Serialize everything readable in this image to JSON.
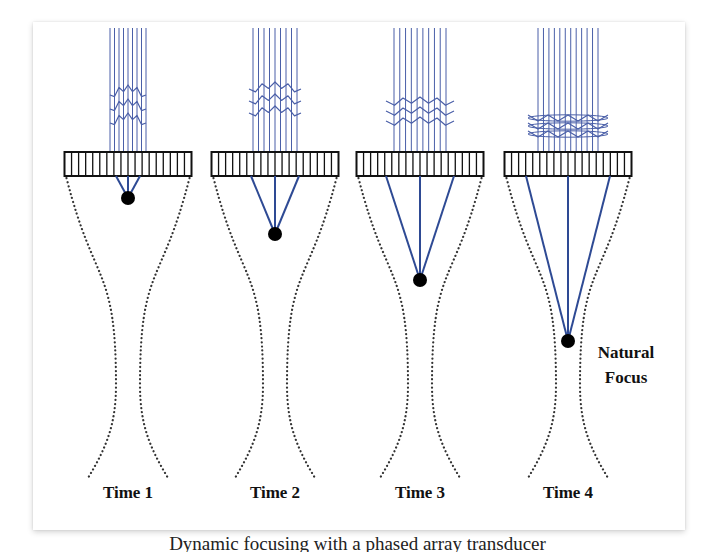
{
  "figure": {
    "panels": [
      {
        "label": "Time 1",
        "cx": 128,
        "focus_y": 198
      },
      {
        "label": "Time 2",
        "cx": 275,
        "focus_y": 234
      },
      {
        "label": "Time 3",
        "cx": 420,
        "focus_y": 280
      },
      {
        "label": "Time 4",
        "cx": 568,
        "focus_y": 341
      }
    ],
    "natural_focus_label_line1": "Natural",
    "natural_focus_label_line2": "Focus",
    "colors": {
      "wave_lines": "#4a5fa8",
      "focus_lines": "#2e4a94",
      "transducer": "#111111",
      "beam_edge": "#333333",
      "focus_dot": "#000000"
    },
    "transducer_elements": 18
  },
  "caption": {
    "text": "Dynamic focusing with a phased array transducer"
  }
}
